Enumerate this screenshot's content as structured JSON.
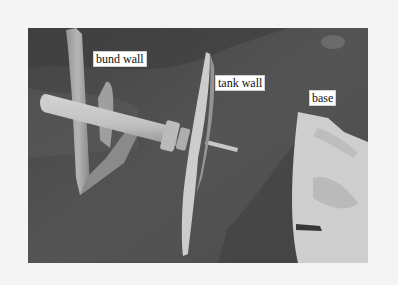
{
  "figure": {
    "labels": {
      "bund_wall": "bund wall",
      "tank_wall": "tank wall",
      "base": "base"
    },
    "colors": {
      "page_background": "#f4f4f4",
      "ground": "#3a3a3a",
      "metal": "#bdbdbd",
      "base_plate": "#e6e6e6",
      "label_background": "#ffffff"
    }
  }
}
